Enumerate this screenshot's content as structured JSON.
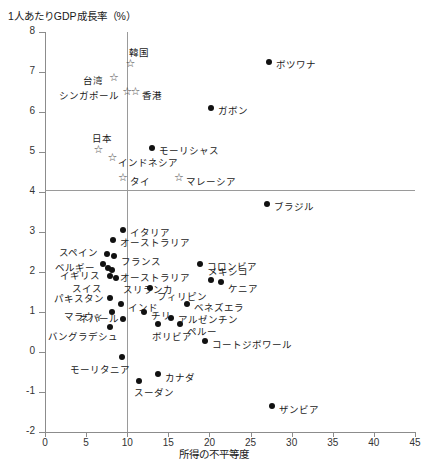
{
  "chart_data": {
    "type": "scatter",
    "title": "1人あたりGDP成長率（%）",
    "ylabel": "1人あたりGDP成長率（%）",
    "xlabel": "所得の不平等度",
    "xlim": [
      0,
      45
    ],
    "ylim": [
      -2,
      8
    ],
    "xticks": [
      "0",
      "5",
      "10",
      "15",
      "20",
      "25",
      "30",
      "35",
      "40",
      "45"
    ],
    "yticks": [
      "8",
      "7",
      "6",
      "5",
      "4",
      "3",
      "2",
      "1",
      "0",
      "-1",
      "-2"
    ],
    "grid": false,
    "reference_lines": {
      "horizontal_y": 4,
      "vertical_x": 10
    },
    "legend": "",
    "marker_types": {
      "circle": "filled-dot",
      "star": "open-star"
    },
    "points": [
      {
        "label": "韓国",
        "x": 10.4,
        "y": 7.2,
        "marker": "star",
        "lx": -2,
        "ly": -19
      },
      {
        "label": "ボツワナ",
        "x": 27.3,
        "y": 7.25,
        "marker": "circle",
        "lx": 7,
        "ly": -5
      },
      {
        "label": "台湾",
        "x": 8.4,
        "y": 6.85,
        "marker": "star",
        "lx": -31,
        "ly": -5
      },
      {
        "label": "シンガポール",
        "x": 10.0,
        "y": 6.5,
        "marker": "star",
        "lx": -68,
        "ly": -4
      },
      {
        "label": "香港",
        "x": 11.0,
        "y": 6.5,
        "marker": "star",
        "lx": 7,
        "ly": -4
      },
      {
        "label": "ガボン",
        "x": 20.2,
        "y": 6.1,
        "marker": "circle",
        "lx": 7,
        "ly": -5
      },
      {
        "label": "日本",
        "x": 6.5,
        "y": 5.05,
        "marker": "star",
        "lx": -6,
        "ly": -19
      },
      {
        "label": "モーリシャス",
        "x": 13.0,
        "y": 5.1,
        "marker": "circle",
        "lx": 7,
        "ly": -5
      },
      {
        "label": "インドネシア",
        "x": 8.2,
        "y": 4.85,
        "marker": "star",
        "lx": 6,
        "ly": -3
      },
      {
        "label": "タイ",
        "x": 9.5,
        "y": 4.35,
        "marker": "star",
        "lx": 7,
        "ly": -4
      },
      {
        "label": "マレーシア",
        "x": 16.3,
        "y": 4.35,
        "marker": "star",
        "lx": 7,
        "ly": -4
      },
      {
        "label": "ブラジル",
        "x": 27.0,
        "y": 3.7,
        "marker": "circle",
        "lx": 7,
        "ly": -5
      },
      {
        "label": "イタリア",
        "x": 9.5,
        "y": 3.05,
        "marker": "circle",
        "lx": 7,
        "ly": -5
      },
      {
        "label": "オーストラリア",
        "x": 8.3,
        "y": 2.8,
        "marker": "circle",
        "lx": 7,
        "ly": -5
      },
      {
        "label": "スペイン",
        "x": 7.6,
        "y": 2.45,
        "marker": "circle",
        "lx": -48,
        "ly": -9
      },
      {
        "label": "フランス",
        "x": 8.4,
        "y": 2.4,
        "marker": "circle",
        "lx": 7,
        "ly": -2
      },
      {
        "label": "ベルギー",
        "x": 7.0,
        "y": 2.2,
        "marker": "circle",
        "lx": -48,
        "ly": -4
      },
      {
        "label": "イギリス",
        "x": 7.7,
        "y": 2.1,
        "marker": "circle",
        "lx": -48,
        "ly": 0
      },
      {
        "label": "オーストラリア",
        "x": 8.2,
        "y": 2.05,
        "marker": "circle",
        "lx": 8,
        "ly": 0
      },
      {
        "label": "スイス",
        "x": 7.9,
        "y": 1.9,
        "marker": "circle",
        "lx": -38,
        "ly": 5
      },
      {
        "label": "スリランカ",
        "x": 8.6,
        "y": 1.85,
        "marker": "circle",
        "lx": 7,
        "ly": 4
      },
      {
        "label": "コロンビア",
        "x": 18.8,
        "y": 2.2,
        "marker": "circle",
        "lx": 7,
        "ly": -5
      },
      {
        "label": "メキシコ",
        "x": 20.2,
        "y": 1.8,
        "marker": "circle",
        "lx": -3,
        "ly": -16
      },
      {
        "label": "ケニア",
        "x": 21.4,
        "y": 1.75,
        "marker": "circle",
        "lx": 7,
        "ly": -1
      },
      {
        "label": "フィリピン",
        "x": 12.8,
        "y": 1.6,
        "marker": "circle",
        "lx": 7,
        "ly": 1
      },
      {
        "label": "パキスタン",
        "x": 7.9,
        "y": 1.35,
        "marker": "circle",
        "lx": -56,
        "ly": -7
      },
      {
        "label": "インド",
        "x": 9.3,
        "y": 1.2,
        "marker": "circle",
        "lx": 7,
        "ly": -4
      },
      {
        "label": "マラウィ",
        "x": 8.1,
        "y": 1.0,
        "marker": "circle",
        "lx": -48,
        "ly": -3
      },
      {
        "label": "ベネズエラ",
        "x": 17.3,
        "y": 1.2,
        "marker": "circle",
        "lx": 7,
        "ly": -4
      },
      {
        "label": "チリ",
        "x": 12.0,
        "y": 1.0,
        "marker": "circle",
        "lx": 7,
        "ly": -4
      },
      {
        "label": "ネパール",
        "x": 9.5,
        "y": 0.82,
        "marker": "circle",
        "lx": -44,
        "ly": -8
      },
      {
        "label": "アルゼンチン",
        "x": 15.3,
        "y": 0.85,
        "marker": "circle",
        "lx": 7,
        "ly": -6
      },
      {
        "label": "ペルー",
        "x": 16.4,
        "y": 0.7,
        "marker": "circle",
        "lx": 7,
        "ly": 0
      },
      {
        "label": "バングラデシュ",
        "x": 7.9,
        "y": 0.62,
        "marker": "circle",
        "lx": -62,
        "ly": 2
      },
      {
        "label": "ボリビア",
        "x": 13.8,
        "y": 0.7,
        "marker": "circle",
        "lx": -6,
        "ly": 5
      },
      {
        "label": "コートジボワール",
        "x": 19.4,
        "y": 0.28,
        "marker": "circle",
        "lx": 7,
        "ly": -4
      },
      {
        "label": "モーリタニア",
        "x": 9.4,
        "y": -0.12,
        "marker": "circle",
        "lx": -52,
        "ly": 5
      },
      {
        "label": "カナダ",
        "x": 13.8,
        "y": -0.55,
        "marker": "circle",
        "lx": 7,
        "ly": -4
      },
      {
        "label": "スーダン",
        "x": 11.4,
        "y": -0.72,
        "marker": "circle",
        "lx": -5,
        "ly": 4
      },
      {
        "label": "ザンビア",
        "x": 27.6,
        "y": -1.35,
        "marker": "circle",
        "lx": 7,
        "ly": -4
      }
    ]
  }
}
